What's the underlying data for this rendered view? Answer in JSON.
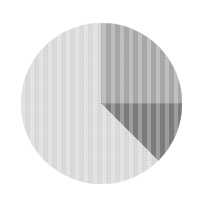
{
  "chart_data": {
    "type": "pie",
    "title": "",
    "subtitle": "",
    "xlabel": "",
    "ylabel": "",
    "grid": false,
    "legend_position": "none",
    "start_angle_deg": 0,
    "direction": "clockwise",
    "center": {
      "x": 101.5,
      "y": 103.5
    },
    "radius": 80.5,
    "categories": [
      "Slice 1",
      "Slice 2",
      "Slice 3"
    ],
    "values": [
      62.5,
      25,
      12.5
    ],
    "labels": [],
    "slices": [
      {
        "name": "Slice 1",
        "value": 62.5,
        "percent": "62.5%",
        "color": "#dcdcdc",
        "start_deg": 135,
        "end_deg": 360
      },
      {
        "name": "Slice 2",
        "value": 25,
        "percent": "25%",
        "color": "#a9a9a9",
        "start_deg": 0,
        "end_deg": 90
      },
      {
        "name": "Slice 3",
        "value": 12.5,
        "percent": "12.5%",
        "color": "#7d7d7d",
        "start_deg": 90,
        "end_deg": 135
      }
    ]
  },
  "figure": {
    "background_color": "#ffffff",
    "width": 205,
    "height": 205
  }
}
